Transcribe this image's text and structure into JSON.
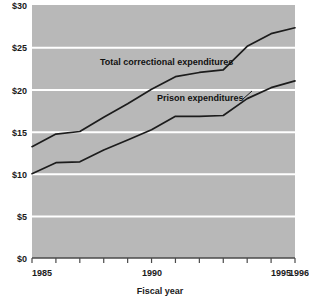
{
  "chart_data": {
    "type": "line",
    "title": "",
    "xlabel": "Fiscal year",
    "ylabel": "",
    "xlim": [
      1985,
      1996
    ],
    "ylim": [
      0,
      30
    ],
    "grid": "horizontal-white",
    "legend": "inline-annotations",
    "plot_background": "#b8b8b8",
    "line_color": "#1c1c1c",
    "gridline_color": "#ffffff",
    "y_ticks": [
      0,
      5,
      10,
      15,
      20,
      25,
      30
    ],
    "y_tick_labels": [
      "$0",
      "$5",
      "$10",
      "$15",
      "$20",
      "$25",
      "$30"
    ],
    "x_ticks": [
      1985,
      1986,
      1987,
      1988,
      1989,
      1990,
      1991,
      1992,
      1993,
      1994,
      1995,
      1996
    ],
    "x_tick_labels_shown": [
      "1985",
      "1990",
      "1995",
      "1996"
    ],
    "x": [
      1985,
      1986,
      1987,
      1988,
      1989,
      1990,
      1991,
      1992,
      1993,
      1994,
      1995,
      1996
    ],
    "series": [
      {
        "name": "Total correctional expenditures",
        "label": "Total correctional expenditures",
        "values": [
          13.2,
          14.7,
          15.0,
          16.7,
          18.3,
          20.0,
          21.5,
          22.0,
          22.3,
          25.1,
          26.6,
          27.3
        ]
      },
      {
        "name": "Prison expenditures",
        "label": "Prison expenditures",
        "values": [
          10.0,
          11.3,
          11.4,
          12.8,
          14.0,
          15.2,
          16.8,
          16.8,
          16.9,
          18.9,
          20.2,
          21.0
        ]
      }
    ],
    "annotations": [
      {
        "text": "Total correctional expenditures",
        "x": 1989.1,
        "y": 23.5
      },
      {
        "text": "Prison expenditures",
        "x": 1991.1,
        "y": 19.0
      }
    ]
  },
  "axis": {
    "x_title": "Fiscal year",
    "year_start_label": "1985",
    "year_mid_label": "1990",
    "year_end_label": "1995",
    "year_last_label": "1996"
  },
  "y_labels": {
    "t0": "$0",
    "t5": "$5",
    "t10": "$10",
    "t15": "$15",
    "t20": "$20",
    "t25": "$25",
    "t30": "$30"
  }
}
